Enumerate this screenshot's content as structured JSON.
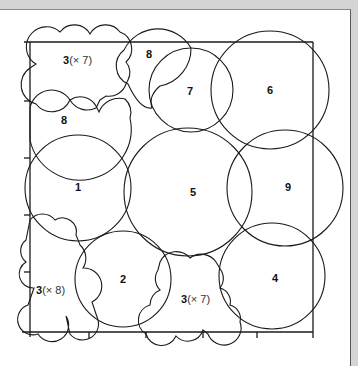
{
  "figure": {
    "type": "circle-packing-diagram",
    "regions": [
      {
        "id": "c1",
        "label": "1",
        "shape": "circle"
      },
      {
        "id": "c2",
        "label": "2",
        "shape": "circle"
      },
      {
        "id": "c4",
        "label": "4",
        "shape": "circle"
      },
      {
        "id": "c5",
        "label": "5",
        "shape": "circle"
      },
      {
        "id": "c6",
        "label": "6",
        "shape": "circle"
      },
      {
        "id": "c7",
        "label": "7",
        "shape": "circle"
      },
      {
        "id": "c9",
        "label": "9",
        "shape": "circle"
      },
      {
        "id": "r8a",
        "label": "8",
        "shape": "scalloped"
      },
      {
        "id": "r8b",
        "label": "8",
        "shape": "scalloped"
      },
      {
        "id": "r3a",
        "label": "3",
        "multiplicity": "(× 7)",
        "shape": "cluster"
      },
      {
        "id": "r3b",
        "label": "3",
        "multiplicity": "(× 8)",
        "shape": "cluster"
      },
      {
        "id": "r3c",
        "label": "3",
        "multiplicity": "(× 7)",
        "shape": "cluster"
      }
    ]
  },
  "labels": {
    "c1": "1",
    "c2": "2",
    "c4": "4",
    "c5": "5",
    "c6": "6",
    "c7": "7",
    "c9": "9",
    "r8a": "8",
    "r8b": "8",
    "r3a_num": "3",
    "r3a_mult": "(× 7)",
    "r3b_num": "3",
    "r3b_mult": "(× 8)",
    "r3c_num": "3",
    "r3c_mult": "(× 7)"
  },
  "colors": {
    "stroke": "#1a1a1a",
    "background": "#ffffff",
    "frame": "#d4d4d4"
  }
}
